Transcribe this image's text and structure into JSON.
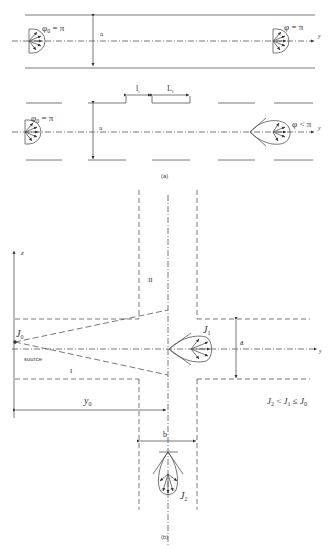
{
  "panel_a": {
    "caption": "(a)",
    "top": {
      "left_label_phi": "φ",
      "left_label_sub": "0",
      "left_label_rest": " = π",
      "right_label": "φ = π",
      "width_label": "a",
      "axis_label": "y"
    },
    "bottom": {
      "left_label_phi": "φ",
      "left_label_sub": "0",
      "left_label_rest": " = π",
      "right_label": "φ < π",
      "width_label": "a",
      "gap_label": "l",
      "gap_sub": "i",
      "segment_label": "L",
      "segment_sub": "i",
      "axis_label": "y"
    }
  },
  "panel_b": {
    "caption": "(b)",
    "vertical_axis_label": "z",
    "horizontal_axis_label": "y",
    "region_labels": [
      "II",
      "I"
    ],
    "source_label": "source",
    "J0": {
      "base": "J",
      "sub": "0"
    },
    "J1": {
      "base": "J",
      "sub": "1"
    },
    "J2": {
      "base": "J",
      "sub": "2"
    },
    "y0": {
      "base": "y",
      "sub": "0"
    },
    "width_a_label": "a",
    "width_b_label": "b",
    "inequality": {
      "parts": [
        "J",
        "2",
        " < ",
        "J",
        "1",
        " ≤ ",
        "J",
        "0"
      ]
    }
  },
  "colors": {
    "line": "#555555",
    "text": "#333333",
    "background": "#ffffff"
  }
}
